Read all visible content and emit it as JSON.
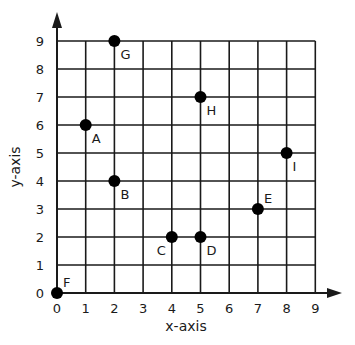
{
  "chart_data": {
    "type": "scatter",
    "title": "",
    "xlabel": "x-axis",
    "ylabel": "y-axis",
    "xlim": [
      0,
      9
    ],
    "ylim": [
      0,
      9
    ],
    "grid": true,
    "x_ticks": [
      "0",
      "1",
      "2",
      "3",
      "4",
      "5",
      "6",
      "7",
      "8",
      "9"
    ],
    "y_ticks": [
      "0",
      "1",
      "2",
      "3",
      "4",
      "5",
      "6",
      "7",
      "8",
      "9"
    ],
    "points": [
      {
        "label": "A",
        "x": 1,
        "y": 6,
        "label_pos": "below-right"
      },
      {
        "label": "B",
        "x": 2,
        "y": 4,
        "label_pos": "below-right"
      },
      {
        "label": "C",
        "x": 4,
        "y": 2,
        "label_pos": "below-left"
      },
      {
        "label": "D",
        "x": 5,
        "y": 2,
        "label_pos": "below-right"
      },
      {
        "label": "E",
        "x": 7,
        "y": 3,
        "label_pos": "above-right"
      },
      {
        "label": "F",
        "x": 0,
        "y": 0,
        "label_pos": "above-right"
      },
      {
        "label": "G",
        "x": 2,
        "y": 9,
        "label_pos": "below-right"
      },
      {
        "label": "H",
        "x": 5,
        "y": 7,
        "label_pos": "below-right"
      },
      {
        "label": "I",
        "x": 8,
        "y": 5,
        "label_pos": "below-right"
      }
    ],
    "colors": {
      "line": "#1a1a1a",
      "point": "#000000",
      "background": "#ffffff"
    }
  }
}
